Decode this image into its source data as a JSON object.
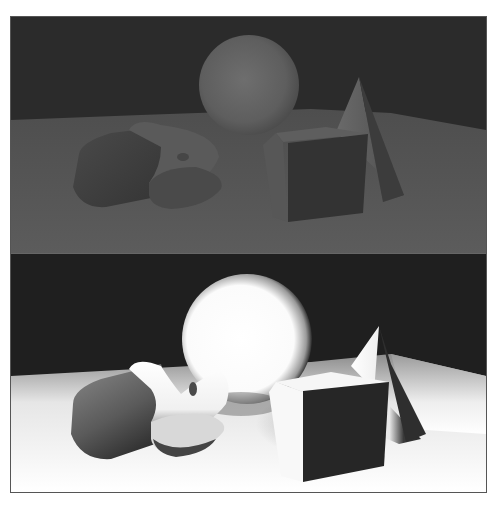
{
  "figure": {
    "frame_color": "#555555",
    "panels": [
      {
        "id": "top",
        "lighting": "dim ambient",
        "background_color": "#2a2a2a",
        "floor_color": "#5a5a5a",
        "objects": [
          "sphere",
          "cylinder",
          "torus-slab",
          "cube",
          "cone"
        ]
      },
      {
        "id": "bottom",
        "lighting": "bright directional",
        "background_color": "#1e1e1e",
        "floor_color": "#f4f4f4",
        "objects": [
          "sphere",
          "cylinder",
          "torus-slab",
          "cube",
          "cone"
        ]
      }
    ]
  }
}
